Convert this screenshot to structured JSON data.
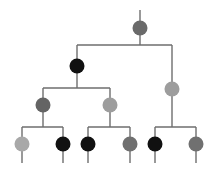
{
  "figure": {
    "width": 217,
    "height": 171,
    "background_color": "#ffffff",
    "edge_color": "#6e6e6e",
    "edge_width": 1.4,
    "node_radius": 7.5
  },
  "palette": {
    "black": "#111111",
    "dark_gray": "#5e5e5e",
    "medium_gray": "#6e6e6e",
    "mid_gray": "#808080",
    "light_gray": "#9d9d9d",
    "lighter_gray": "#a8a8a8"
  },
  "nodes": [
    {
      "id": "root",
      "label": "root-node",
      "x": 140,
      "y": 28,
      "r": 7.5,
      "color": "#6a6a6a",
      "shade": "medium-gray",
      "level": 0
    },
    {
      "id": "n1",
      "label": "level1-left-node",
      "x": 77,
      "y": 66,
      "r": 7.5,
      "color": "#111111",
      "shade": "black",
      "level": 1
    },
    {
      "id": "n2",
      "label": "level1-right-node",
      "x": 172,
      "y": 89,
      "r": 7.5,
      "color": "#9d9d9d",
      "shade": "light-gray",
      "level": 1
    },
    {
      "id": "n3",
      "label": "level2-left-node",
      "x": 43,
      "y": 105,
      "r": 7.5,
      "color": "#646464",
      "shade": "dark-gray",
      "level": 2
    },
    {
      "id": "n4",
      "label": "level2-right-node",
      "x": 110,
      "y": 105,
      "r": 7.5,
      "color": "#9d9d9d",
      "shade": "light-gray",
      "level": 2
    },
    {
      "id": "l1",
      "label": "leaf-node-1",
      "x": 22,
      "y": 144,
      "r": 7.5,
      "color": "#a8a8a8",
      "shade": "lighter-gray",
      "level": 3
    },
    {
      "id": "l2",
      "label": "leaf-node-2",
      "x": 63,
      "y": 144,
      "r": 7.5,
      "color": "#111111",
      "shade": "black",
      "level": 3
    },
    {
      "id": "l3",
      "label": "leaf-node-3",
      "x": 88,
      "y": 144,
      "r": 7.5,
      "color": "#111111",
      "shade": "black",
      "level": 3
    },
    {
      "id": "l4",
      "label": "leaf-node-4",
      "x": 130,
      "y": 144,
      "r": 7.5,
      "color": "#707070",
      "shade": "mid-gray",
      "level": 3
    },
    {
      "id": "l5",
      "label": "leaf-node-5",
      "x": 155,
      "y": 144,
      "r": 7.5,
      "color": "#111111",
      "shade": "black",
      "level": 3
    },
    {
      "id": "l6",
      "label": "leaf-node-6",
      "x": 196,
      "y": 144,
      "r": 7.5,
      "color": "#707070",
      "shade": "mid-gray",
      "level": 3
    }
  ],
  "edges": [
    {
      "id": "e-root-stem",
      "label": "root-top-stem",
      "points": "140,10 140,28"
    },
    {
      "id": "e-root-down",
      "label": "root-down-stem",
      "points": "140,28 140,45"
    },
    {
      "id": "e-bar-1",
      "label": "level1-horizontal-bar",
      "points": "77,45 172,45"
    },
    {
      "id": "e-n1-up",
      "label": "level1-left-riser",
      "points": "77,45 77,66"
    },
    {
      "id": "e-n2-up",
      "label": "level1-right-riser",
      "points": "172,45 172,89"
    },
    {
      "id": "e-n1-down",
      "label": "level1-left-down-stem",
      "points": "77,66 77,88"
    },
    {
      "id": "e-bar-2",
      "label": "level2-horizontal-bar",
      "points": "43,88 110,88"
    },
    {
      "id": "e-n3-up",
      "label": "level2-left-riser",
      "points": "43,88 43,105"
    },
    {
      "id": "e-n4-up",
      "label": "level2-right-riser",
      "points": "110,88 110,105"
    },
    {
      "id": "e-n3-down",
      "label": "level2-left-down-stem",
      "points": "43,105 43,127"
    },
    {
      "id": "e-n4-down",
      "label": "level2-right-down-stem",
      "points": "110,105 110,127"
    },
    {
      "id": "e-n2-down",
      "label": "level1-right-down-stem",
      "points": "172,89 172,127"
    },
    {
      "id": "e-bar-3a",
      "label": "leaf-bar-left",
      "points": "22,127 63,127"
    },
    {
      "id": "e-bar-3b",
      "label": "leaf-bar-middle",
      "points": "88,127 130,127"
    },
    {
      "id": "e-bar-3c",
      "label": "leaf-bar-right",
      "points": "155,127 196,127"
    },
    {
      "id": "e-l1-up",
      "label": "leaf-1-riser",
      "points": "22,127 22,144"
    },
    {
      "id": "e-l2-up",
      "label": "leaf-2-riser",
      "points": "63,127 63,144"
    },
    {
      "id": "e-l3-up",
      "label": "leaf-3-riser",
      "points": "88,127 88,144"
    },
    {
      "id": "e-l4-up",
      "label": "leaf-4-riser",
      "points": "130,127 130,144"
    },
    {
      "id": "e-l5-up",
      "label": "leaf-5-riser",
      "points": "155,127 155,144"
    },
    {
      "id": "e-l6-up",
      "label": "leaf-6-riser",
      "points": "196,127 196,144"
    },
    {
      "id": "e-l1-tail",
      "label": "leaf-1-tail",
      "points": "22,144 22,163"
    },
    {
      "id": "e-l2-tail",
      "label": "leaf-2-tail",
      "points": "63,144 63,163"
    },
    {
      "id": "e-l3-tail",
      "label": "leaf-3-tail",
      "points": "88,144 88,163"
    },
    {
      "id": "e-l4-tail",
      "label": "leaf-4-tail",
      "points": "130,144 130,163"
    },
    {
      "id": "e-l5-tail",
      "label": "leaf-5-tail",
      "points": "155,144 155,163"
    },
    {
      "id": "e-l6-tail",
      "label": "leaf-6-tail",
      "points": "196,144 196,163"
    }
  ]
}
